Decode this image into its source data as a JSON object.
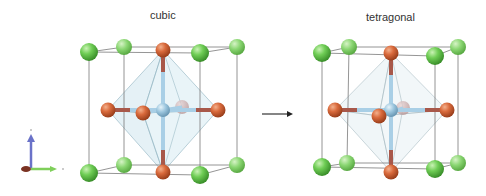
{
  "panels": [
    {
      "title": "cubic"
    },
    {
      "title": "tetragonal"
    }
  ],
  "transition": {
    "icon": "arrow-right-icon"
  },
  "axes_indicator": {
    "x_color": "#7fcf5a",
    "y_color": "#6a72c8",
    "z_color": "#8a3a2a"
  },
  "colors": {
    "cation_a": "#6fcd55",
    "cation_a_dark": "#3f9a2e",
    "anion": "#d96a3c",
    "anion_dark": "#a84a24",
    "cation_b": "#9cc6de",
    "bond_b": "#a9cfe6",
    "bond_anion": "#a8584a",
    "octahedron_fill": "#cfe6ef",
    "cell_edge": "#7a7a7a"
  }
}
